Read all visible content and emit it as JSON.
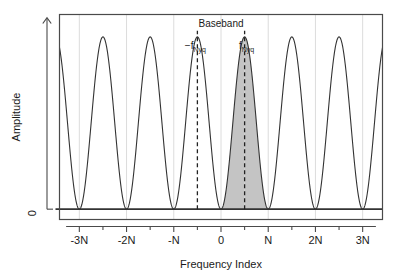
{
  "figure": {
    "background_color": "#ffffff",
    "frame_color": "#404040",
    "curve_color": "#333333",
    "grid_color": "#dcdcdc",
    "shade_color": "#c4c4c4",
    "dash_color": "#222222",
    "zero_line_color": "#333333"
  },
  "axes": {
    "x": {
      "title": "Frequency Index",
      "tick_labels": [
        "-3N",
        "-2N",
        "-N",
        "0",
        "N",
        "2N",
        "3N"
      ],
      "tick_values": [
        -3,
        -2,
        -1,
        0,
        1,
        2,
        3
      ],
      "minor_tick_values": [
        -2.5,
        -1.5,
        -0.5,
        0.5,
        1.5,
        2.5
      ],
      "xlim": [
        -3.42,
        3.42
      ],
      "grid": true
    },
    "y": {
      "title": "Amplitude",
      "tick_labels": [
        "0"
      ],
      "tick_values": [
        0
      ],
      "ylim": [
        -0.06,
        1.13
      ],
      "grid": false,
      "arrow": "up-arrow"
    }
  },
  "annotations": {
    "baseband": {
      "label": "Baseband",
      "x": 0,
      "y": 1.06
    },
    "neg_nyq": {
      "label_prefix": "−f",
      "label_sub": "Nyq",
      "x": -0.5,
      "y": 0.93
    },
    "pos_nyq": {
      "label_prefix": "f",
      "label_sub": "Nyq",
      "x": 0.5,
      "y": 0.93
    },
    "dashed_lines_x": [
      -0.5,
      0.5
    ]
  },
  "chart_data": {
    "type": "line",
    "title": "",
    "subtitle": "",
    "xlabel": "Frequency Index",
    "ylabel": "Amplitude",
    "xlim": [
      -3.42,
      3.42
    ],
    "ylim": [
      -0.06,
      1.13
    ],
    "grid": true,
    "legend": "none",
    "series": [
      {
        "name": "Aliased spectrum (periodic replicas)",
        "description": "Raised-cosine lobes repeating every N: y = 0.5*(1 - cos(2*pi*x)) normalized to peak 1.0, peaks at integer multiples of N, zeros at half-integer multiples of N",
        "period": 1,
        "peak_amplitude": 1.0,
        "minimum_amplitude": 0.0,
        "peak_x_values": [
          -3,
          -2,
          -1,
          0,
          1,
          2,
          3
        ],
        "zero_x_values": [
          -2.5,
          -1.5,
          -0.5,
          0.5,
          1.5,
          2.5
        ],
        "x": [
          -3.42,
          -3.3,
          -3.2,
          -3.1,
          -3.0,
          -2.9,
          -2.8,
          -2.7,
          -2.6,
          -2.5,
          -2.4,
          -2.3,
          -2.2,
          -2.1,
          -2.0,
          -1.9,
          -1.8,
          -1.7,
          -1.6,
          -1.5,
          -1.4,
          -1.3,
          -1.2,
          -1.1,
          -1.0,
          -0.9,
          -0.8,
          -0.7,
          -0.6,
          -0.5,
          -0.4,
          -0.3,
          -0.2,
          -0.1,
          0.0,
          0.1,
          0.2,
          0.3,
          0.4,
          0.5,
          0.6,
          0.7,
          0.8,
          0.9,
          1.0,
          1.1,
          1.2,
          1.3,
          1.4,
          1.5,
          1.6,
          1.7,
          1.8,
          1.9,
          2.0,
          2.1,
          2.2,
          2.3,
          2.4,
          2.5,
          2.6,
          2.7,
          2.8,
          2.9,
          3.0,
          3.1,
          3.2,
          3.3,
          3.42
        ],
        "y": [
          0.47,
          0.79,
          0.9,
          0.98,
          1.0,
          0.98,
          0.9,
          0.79,
          0.65,
          0.5,
          0.35,
          0.21,
          0.1,
          0.02,
          0.0,
          0.02,
          0.1,
          0.21,
          0.35,
          0.5,
          0.65,
          0.79,
          0.9,
          0.98,
          1.0,
          0.98,
          0.9,
          0.79,
          0.65,
          0.5,
          0.35,
          0.21,
          0.1,
          0.02,
          0.0,
          0.02,
          0.1,
          0.21,
          0.35,
          0.5,
          0.65,
          0.79,
          0.9,
          0.98,
          1.0,
          0.98,
          0.9,
          0.79,
          0.65,
          0.5,
          0.35,
          0.21,
          0.1,
          0.02,
          0.0,
          0.02,
          0.1,
          0.21,
          0.35,
          0.5,
          0.65,
          0.79,
          0.9,
          0.98,
          1.0,
          0.98,
          0.9,
          0.79,
          0.47
        ]
      }
    ],
    "shaded_regions": [
      {
        "name": "baseband-positive-half",
        "x_start": 0.0,
        "x_end": 0.5,
        "fill": "#c4c4c4",
        "note": "area under the descending flank of the 0-centred lobe"
      },
      {
        "name": "first-alias-rising-flank",
        "x_start": 0.5,
        "x_end": 1.0,
        "fill": "#c4c4c4",
        "note": "area under the ascending flank of the N-centred lobe"
      }
    ],
    "annotations": [
      {
        "text": "Baseband",
        "x": 0,
        "y": 1.06
      },
      {
        "text": "-f_Nyq",
        "x": -0.5,
        "y": 0.93
      },
      {
        "text": "f_Nyq",
        "x": 0.5,
        "y": 0.93
      }
    ],
    "reference_lines": [
      {
        "type": "vertical-dashed",
        "x": -0.5
      },
      {
        "type": "vertical-dashed",
        "x": 0.5
      },
      {
        "type": "horizontal-solid",
        "y": 0.0
      }
    ]
  }
}
